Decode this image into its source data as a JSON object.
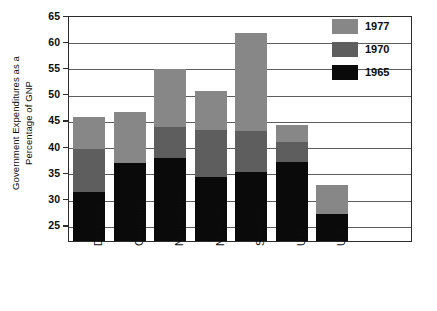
{
  "chart_data": {
    "type": "bar",
    "subtype": "stacked-bar",
    "title": "",
    "xlabel": "",
    "ylabel": "Government Expenditures as a Percentage of GNP",
    "ylabel_lines": [
      "Government Expenditures as a",
      "Percentage of GNP"
    ],
    "ylim": [
      21.9,
      65
    ],
    "yticks": [
      25,
      30,
      35,
      40,
      45,
      50,
      55,
      60,
      65
    ],
    "ytick_labels": [
      "25",
      "30",
      "35",
      "40",
      "45",
      "50",
      "55",
      "60",
      "65"
    ],
    "grid": true,
    "grid_axis": "y",
    "legend_position": "top-right",
    "categories": [
      "Denmark",
      "Germany",
      "Netherlands",
      "Norway",
      "Sweden",
      "U.K.",
      "U.S."
    ],
    "series": [
      {
        "name": "1965",
        "color": "#0a0a0a",
        "values": [
          31.2,
          36.8,
          37.8,
          34.1,
          35.0,
          36.9,
          27.1
        ]
      },
      {
        "name": "1970",
        "color": "#5e5e5e",
        "values": [
          39.5,
          36.8,
          43.7,
          43.0,
          42.9,
          40.7,
          27.1
        ]
      },
      {
        "name": "1977",
        "color": "#878787",
        "values": [
          45.5,
          46.5,
          54.7,
          50.5,
          61.6,
          44.0,
          32.5
        ]
      }
    ],
    "note": "series values are cumulative bar tops read off the axis; segment heights are the differences"
  },
  "legend": {
    "entries": [
      {
        "label": "1977",
        "color": "#878787"
      },
      {
        "label": "1970",
        "color": "#5e5e5e"
      },
      {
        "label": "1965",
        "color": "#0a0a0a"
      }
    ]
  },
  "axes": {
    "y": {
      "ticks": [
        "65",
        "60",
        "55",
        "50",
        "45",
        "40",
        "35",
        "30",
        "25"
      ]
    },
    "x": {
      "ticks": [
        "Denmark",
        "Germany",
        "Netherlands",
        "Norway",
        "Sweden",
        "U.K.",
        "U.S."
      ]
    }
  }
}
